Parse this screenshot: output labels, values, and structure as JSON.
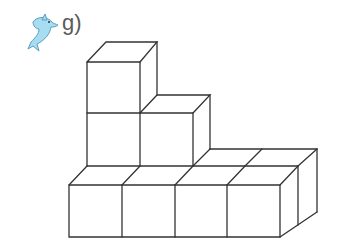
{
  "exercise": {
    "label": "g)",
    "icon": "dolphin-icon",
    "icon_color": "#a8dcf0"
  },
  "figure": {
    "line_color": "#333333"
  }
}
